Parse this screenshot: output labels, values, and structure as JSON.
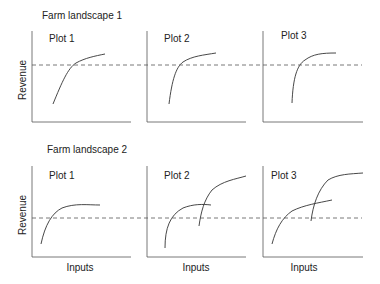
{
  "landscapes": [
    {
      "title": "Farm landscape 1",
      "ylabel": "Revenue",
      "plots": [
        {
          "label": "Plot 1"
        },
        {
          "label": "Plot 2"
        },
        {
          "label": "Plot 3"
        }
      ]
    },
    {
      "title": "Farm landscape 2",
      "ylabel": "Revenue",
      "xlabel": "Inputs",
      "plots": [
        {
          "label": "Plot 1",
          "xlabel": "Inputs"
        },
        {
          "label": "Plot 2",
          "xlabel": "Inputs"
        },
        {
          "label": "Plot 3",
          "xlabel": "Inputs"
        }
      ]
    }
  ],
  "colors": {
    "line": "#333333",
    "axis": "#555555",
    "dash": "#555555"
  }
}
